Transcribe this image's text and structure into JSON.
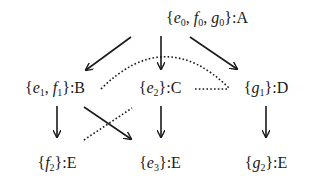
{
  "diagram": {
    "type": "lattice/tree",
    "nodes": [
      {
        "id": "A",
        "set": [
          {
            "v": "e",
            "s": "0"
          },
          {
            "v": "f",
            "s": "0"
          },
          {
            "v": "g",
            "s": "0"
          }
        ],
        "label": "A",
        "x": 207,
        "y": 18
      },
      {
        "id": "B",
        "set": [
          {
            "v": "e",
            "s": "1"
          },
          {
            "v": "f",
            "s": "1"
          }
        ],
        "label": "B",
        "x": 55,
        "y": 88
      },
      {
        "id": "C",
        "set": [
          {
            "v": "e",
            "s": "2"
          }
        ],
        "label": "C",
        "x": 160,
        "y": 88
      },
      {
        "id": "D",
        "set": [
          {
            "v": "g",
            "s": "1"
          }
        ],
        "label": "D",
        "x": 266,
        "y": 88
      },
      {
        "id": "E1",
        "set": [
          {
            "v": "f",
            "s": "2"
          }
        ],
        "label": "E",
        "x": 57,
        "y": 163
      },
      {
        "id": "E2",
        "set": [
          {
            "v": "e",
            "s": "3"
          }
        ],
        "label": "E",
        "x": 160,
        "y": 163
      },
      {
        "id": "E3",
        "set": [
          {
            "v": "g",
            "s": "2"
          }
        ],
        "label": "E",
        "x": 266,
        "y": 163
      }
    ],
    "edges": [
      {
        "from": "A",
        "to": "B",
        "style": "solid-arrow"
      },
      {
        "from": "A",
        "to": "C",
        "style": "solid-arrow"
      },
      {
        "from": "A",
        "to": "D",
        "style": "solid-arrow"
      },
      {
        "from": "B",
        "to": "E1",
        "style": "solid-arrow"
      },
      {
        "from": "B",
        "to": "E2",
        "style": "solid-arrow"
      },
      {
        "from": "C",
        "to": "E2",
        "style": "solid-arrow"
      },
      {
        "from": "D",
        "to": "E3",
        "style": "solid-arrow"
      },
      {
        "from": "B",
        "to": "D",
        "style": "dotted-arc"
      },
      {
        "from": "C",
        "to": "D",
        "style": "dotted-line"
      },
      {
        "from": "C",
        "to": "E1",
        "style": "dotted-line"
      }
    ],
    "colors": {
      "ink": "#1a1a1a",
      "background": "#ffffff"
    }
  }
}
